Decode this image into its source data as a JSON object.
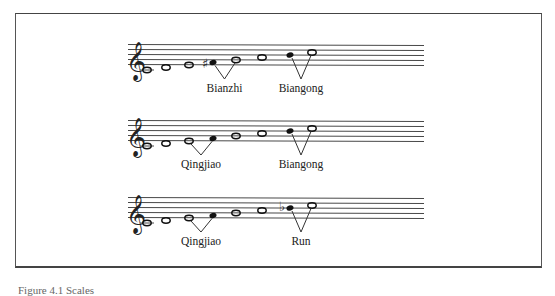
{
  "figure": {
    "staves": [
      {
        "clef": "treble",
        "notes": [
          {
            "pitch": "C4",
            "step": -2,
            "filled": false,
            "accidental": null
          },
          {
            "pitch": "D4",
            "step": -1,
            "filled": false,
            "accidental": null
          },
          {
            "pitch": "E4",
            "step": 0,
            "filled": false,
            "accidental": null
          },
          {
            "pitch": "F#4",
            "step": 1,
            "filled": true,
            "accidental": "sharp"
          },
          {
            "pitch": "G4",
            "step": 2,
            "filled": false,
            "accidental": null
          },
          {
            "pitch": "A4",
            "step": 3,
            "filled": false,
            "accidental": null
          },
          {
            "pitch": "B4",
            "step": 4,
            "filled": true,
            "accidental": null
          },
          {
            "pitch": "C5",
            "step": 5,
            "filled": false,
            "accidental": null
          }
        ],
        "brackets": [
          {
            "from": 3,
            "to": 4,
            "label": "Bianzhi"
          },
          {
            "from": 6,
            "to": 7,
            "label": "Biangong"
          }
        ]
      },
      {
        "clef": "treble",
        "notes": [
          {
            "pitch": "C4",
            "step": -2,
            "filled": false,
            "accidental": null
          },
          {
            "pitch": "D4",
            "step": -1,
            "filled": false,
            "accidental": null
          },
          {
            "pitch": "E4",
            "step": 0,
            "filled": false,
            "accidental": null
          },
          {
            "pitch": "F4",
            "step": 1,
            "filled": true,
            "accidental": null
          },
          {
            "pitch": "G4",
            "step": 2,
            "filled": false,
            "accidental": null
          },
          {
            "pitch": "A4",
            "step": 3,
            "filled": false,
            "accidental": null
          },
          {
            "pitch": "B4",
            "step": 4,
            "filled": true,
            "accidental": null
          },
          {
            "pitch": "C5",
            "step": 5,
            "filled": false,
            "accidental": null
          }
        ],
        "brackets": [
          {
            "from": 2,
            "to": 3,
            "label": "Qingjiao"
          },
          {
            "from": 6,
            "to": 7,
            "label": "Biangong"
          }
        ]
      },
      {
        "clef": "treble",
        "notes": [
          {
            "pitch": "C4",
            "step": -2,
            "filled": false,
            "accidental": null
          },
          {
            "pitch": "D4",
            "step": -1,
            "filled": false,
            "accidental": null
          },
          {
            "pitch": "E4",
            "step": 0,
            "filled": false,
            "accidental": null
          },
          {
            "pitch": "F4",
            "step": 1,
            "filled": true,
            "accidental": null
          },
          {
            "pitch": "G4",
            "step": 2,
            "filled": false,
            "accidental": null
          },
          {
            "pitch": "A4",
            "step": 3,
            "filled": false,
            "accidental": null
          },
          {
            "pitch": "Bb4",
            "step": 4,
            "filled": true,
            "accidental": "flat"
          },
          {
            "pitch": "C5",
            "step": 5,
            "filled": false,
            "accidental": null
          }
        ],
        "brackets": [
          {
            "from": 2,
            "to": 3,
            "label": "Qingjiao"
          },
          {
            "from": 6,
            "to": 7,
            "label": "Run"
          }
        ]
      }
    ],
    "symbols": {
      "clef_glyph": "𝄞",
      "sharp_glyph": "♯",
      "flat_glyph": "♭"
    },
    "caption": "Figure 4.1 Scales"
  }
}
